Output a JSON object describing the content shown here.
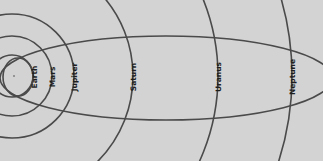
{
  "diagram": {
    "title": "",
    "colors": {
      "background": "#d3d3d3",
      "orbit_stroke": "#4a4a4a",
      "label": "#1e1e1e",
      "margin": "#ffffff"
    },
    "center": {
      "x": 12,
      "y": 76
    },
    "inner_orbit": {
      "name": "Earth",
      "cx": 18,
      "cy": 77,
      "rx": 15,
      "ry": 19
    },
    "comet_orbit": {
      "cx": 166,
      "cy": 78,
      "rx": 166,
      "ry": 42
    },
    "planets": [
      {
        "name": "Earth",
        "radius": 21,
        "label_x": 34,
        "label_y": 77
      },
      {
        "name": "Mars",
        "radius": 40,
        "label_x": 52,
        "label_y": 77
      },
      {
        "name": "Jupiter",
        "radius": 62,
        "label_x": 74,
        "label_y": 77
      },
      {
        "name": "Saturn",
        "radius": 121,
        "label_x": 133,
        "label_y": 77
      },
      {
        "name": "Uranus",
        "radius": 206,
        "label_x": 218,
        "label_y": 77
      },
      {
        "name": "Neptune",
        "radius": 280,
        "label_x": 292,
        "label_y": 77
      }
    ]
  }
}
